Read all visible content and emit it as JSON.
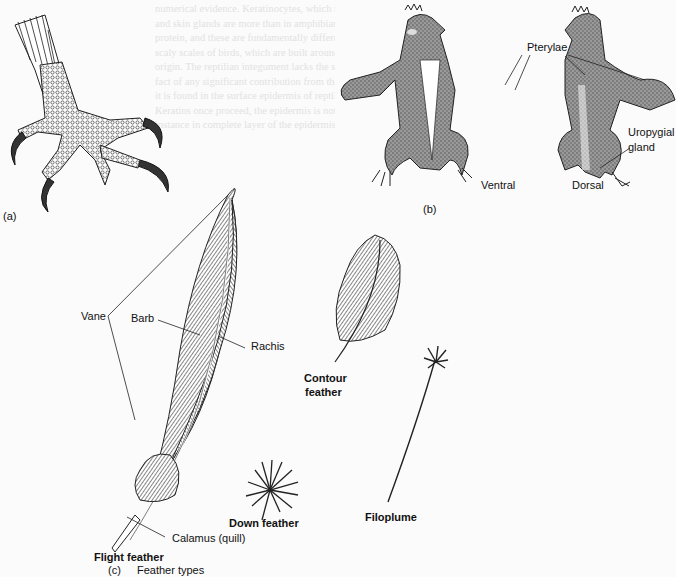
{
  "figure": {
    "panel_a": {
      "label": "(a)"
    },
    "panel_b": {
      "label": "(b)",
      "labels": {
        "pterylae": "Pterylae",
        "uropygial_gland_line1": "Uropygial",
        "uropygial_gland_line2": "gland",
        "ventral": "Ventral",
        "dorsal": "Dorsal"
      }
    },
    "panel_c": {
      "label": "(c)",
      "title": "Feather types",
      "labels": {
        "vane": "Vane",
        "barb": "Barb",
        "rachis": "Rachis",
        "calamus": "Calamus (quill)",
        "flight_feather": "Flight feather",
        "down_feather": "Down feather",
        "contour_feather_line1": "Contour",
        "contour_feather_line2": "feather",
        "filoplume": "Filoplume"
      }
    }
  },
  "background_text": {
    "faded_lines": [
      "numerical evidence. Keratinocytes, which more numerous",
      "and skin glands are more than in amphibians in this",
      "protein, and these are fundamentally different than the",
      "scaly scales of birds, which are built around the same",
      "origin. The reptilian integument lacks the significant",
      "fact of any significant contribution from the dermis",
      "it is found in the surface epidermis of reptiles and birds.",
      "Keratins once proceed, the epidermis is notable",
      "instance in complete layer of the epidermis is intercal"
    ]
  }
}
